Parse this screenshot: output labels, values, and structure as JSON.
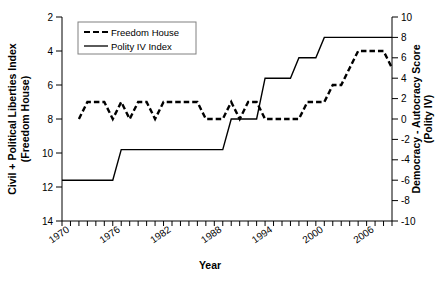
{
  "chart_data": {
    "type": "line",
    "title": "",
    "xlabel": "Year",
    "ylabel": "Civil + Political Liberties Index (Freedom House)",
    "y2label": "Democracy - Autocracy Score (Polity IV)",
    "xlim": [
      1970,
      2009
    ],
    "ylim": [
      14,
      2
    ],
    "y2lim": [
      -10,
      10
    ],
    "y_inverted": true,
    "grid": false,
    "legend_position": "top-left",
    "xticks": [
      1970,
      1976,
      1982,
      1988,
      1994,
      2000,
      2006
    ],
    "xtick_labels": [
      "1970",
      "1976",
      "1982",
      "1988",
      "1994",
      "2000",
      "2006"
    ],
    "xtick_minor_every": 1,
    "yticks": [
      2,
      4,
      6,
      8,
      10,
      12,
      14
    ],
    "ytick_labels": [
      "2",
      "4",
      "6",
      "8",
      "10",
      "12",
      "14"
    ],
    "y2ticks": [
      10,
      8,
      6,
      4,
      2,
      0,
      -2,
      -4,
      -6,
      -8,
      -10
    ],
    "y2tick_labels": [
      "10",
      "8",
      "6",
      "4",
      "2",
      "0",
      "-2",
      "-4",
      "-6",
      "-8",
      "-10"
    ],
    "x": [
      1970,
      1971,
      1972,
      1973,
      1974,
      1975,
      1976,
      1977,
      1978,
      1979,
      1980,
      1981,
      1982,
      1983,
      1984,
      1985,
      1986,
      1987,
      1988,
      1989,
      1990,
      1991,
      1992,
      1993,
      1994,
      1995,
      1996,
      1997,
      1998,
      1999,
      2000,
      2001,
      2002,
      2003,
      2004,
      2005,
      2006,
      2007,
      2008,
      2009
    ],
    "series": [
      {
        "name": "Freedom House",
        "axis": "left",
        "style": "dashed",
        "values": [
          null,
          null,
          8,
          7,
          7,
          7,
          8,
          7,
          8,
          7,
          7,
          8,
          7,
          7,
          7,
          7,
          7,
          8,
          8,
          8,
          7,
          8,
          7,
          7,
          8,
          8,
          8,
          8,
          8,
          7,
          7,
          7,
          6,
          6,
          5,
          4,
          4,
          4,
          4,
          5
        ]
      },
      {
        "name": "Polity IV Index",
        "axis": "right",
        "style": "solid",
        "values": [
          -6,
          -6,
          -6,
          -6,
          -6,
          -6,
          -6,
          -3,
          -3,
          -3,
          -3,
          -3,
          -3,
          -3,
          -3,
          -3,
          -3,
          -3,
          -3,
          -3,
          0,
          0,
          0,
          0,
          4,
          4,
          4,
          4,
          6,
          6,
          6,
          8,
          8,
          8,
          8,
          8,
          8,
          8,
          8,
          8
        ]
      }
    ],
    "legend": [
      {
        "label": "Freedom House",
        "style": "dashed"
      },
      {
        "label": "Polity IV Index",
        "style": "solid"
      }
    ]
  },
  "axes": {
    "left_title_line1": "Civil + Political Liberties Index",
    "left_title_line2": "(Freedom House)",
    "right_title_line1": "Democracy - Autocracy Score",
    "right_title_line2": "(Polity IV)",
    "x_title": "Year"
  }
}
